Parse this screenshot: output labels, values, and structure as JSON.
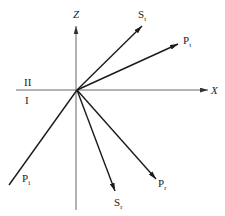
{
  "diagram": {
    "type": "wave-reflection-refraction",
    "colors": {
      "line": "#1a1a1a",
      "axis": "#555555",
      "text": "#222222",
      "background": "#ffffff"
    },
    "origin": {
      "x": 77,
      "y": 90
    },
    "axes": {
      "x": {
        "label": "X",
        "from": [
          16,
          90
        ],
        "to": [
          208,
          90
        ]
      },
      "z": {
        "label": "Z",
        "from": [
          76,
          210
        ],
        "to": [
          76,
          26
        ]
      }
    },
    "media": {
      "upper": "II",
      "lower": "I"
    },
    "rays": [
      {
        "id": "incident-p",
        "label": "P",
        "subscript": "i",
        "from": [
          9,
          185
        ],
        "to": [
          77,
          90
        ],
        "arrow": false
      },
      {
        "id": "transmitted-s",
        "label": "S",
        "subscript": "t",
        "from": [
          77,
          90
        ],
        "to": [
          142,
          26
        ],
        "arrow": true
      },
      {
        "id": "transmitted-p",
        "label": "P",
        "subscript": "t",
        "from": [
          77,
          90
        ],
        "to": [
          178,
          44
        ],
        "arrow": true
      },
      {
        "id": "reflected-s",
        "label": "S",
        "subscript": "r",
        "from": [
          77,
          90
        ],
        "to": [
          115,
          191
        ],
        "arrow": true
      },
      {
        "id": "reflected-p",
        "label": "P",
        "subscript": "r",
        "from": [
          77,
          90
        ],
        "to": [
          156,
          179
        ],
        "arrow": true
      }
    ]
  }
}
